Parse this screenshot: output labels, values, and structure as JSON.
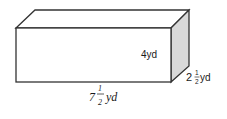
{
  "diagram": {
    "type": "rectangular-prism",
    "colors": {
      "edge": "#333333",
      "front": "#ffffff",
      "top": "#ffffff",
      "side": "#d9d9d9"
    },
    "height_label": {
      "text": "4yd"
    },
    "depth_label": {
      "whole": "2",
      "num": "1",
      "den": "2",
      "unit": "yd"
    },
    "length_label": {
      "whole": "7",
      "num": "1",
      "den": "2",
      "unit": "yd"
    }
  }
}
